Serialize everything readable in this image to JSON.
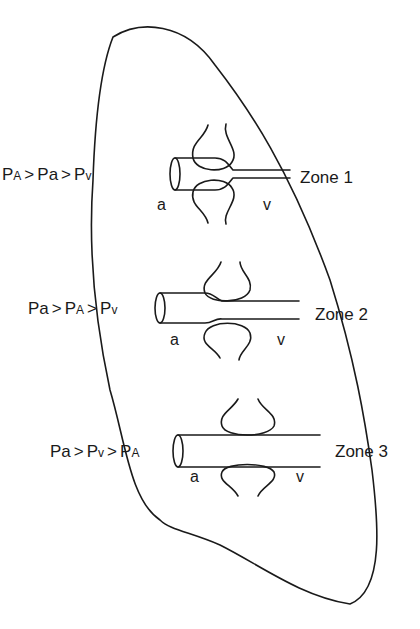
{
  "diagram": {
    "type": "lung-zones-of-west",
    "zones": [
      {
        "name": "Zone 1",
        "condition": {
          "p1": "P",
          "s1": "A",
          "op1": ">",
          "p2": "P",
          "s2": "a",
          "op2": ">",
          "p3": "P",
          "s3": "v"
        },
        "artery_label": "a",
        "vein_label": "v",
        "vessel_state": "collapsed"
      },
      {
        "name": "Zone 2",
        "condition": {
          "p1": "P",
          "s1": "a",
          "op1": ">",
          "p2": "P",
          "s2": "A",
          "op2": ">",
          "p3": "P",
          "s3": "v"
        },
        "artery_label": "a",
        "vein_label": "v",
        "vessel_state": "narrowed"
      },
      {
        "name": "Zone 3",
        "condition": {
          "p1": "P",
          "s1": "a",
          "op1": ">",
          "p2": "P",
          "s2": "v",
          "op2": ">",
          "p3": "P",
          "s3": "A"
        },
        "artery_label": "a",
        "vein_label": "v",
        "vessel_state": "open"
      }
    ]
  }
}
